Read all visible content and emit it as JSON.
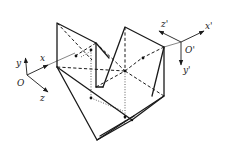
{
  "figure": {
    "world_frame": {
      "origin_label": "O",
      "x_label": "x",
      "y_label": "y",
      "z_label": "z"
    },
    "moving_frame": {
      "origin_label": "O'",
      "x_label": "x'",
      "y_label": "y'",
      "z_label": "z'"
    },
    "line_styles": {
      "visible_edges": "solid",
      "hidden_edges": "dashed",
      "construction_lines": "dotted"
    },
    "colors": {
      "ink": "#1a1a1a",
      "background": "#ffffff"
    }
  }
}
